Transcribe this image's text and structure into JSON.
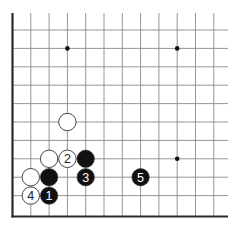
{
  "diagram": {
    "type": "go-board-fragment",
    "corner": "lower-left",
    "colors": {
      "background": "#ffffff",
      "grid": "#8a8a8a",
      "edge": "#2a2a2a",
      "black_stone": "#111111",
      "white_stone": "#ffffff",
      "stone_outline": "#333333",
      "black_label": "#ffffff",
      "white_label": "#222222"
    },
    "grid": {
      "x_lines": [
        12.5,
        30.8,
        49.1,
        67.4,
        85.7,
        104.0,
        122.3,
        140.6,
        158.9,
        177.2,
        195.5,
        213.8
      ],
      "y_lines": [
        30,
        48.4,
        66.8,
        85.2,
        103.6,
        122,
        140.4,
        158.8,
        177.2,
        195.6
      ],
      "bottom_edge_y": 216.5,
      "left_edge_x": 12.5,
      "top_y": 13,
      "right_x": 228
    },
    "hoshi": [
      {
        "col": 3,
        "row": 1
      },
      {
        "col": 9,
        "row": 1
      },
      {
        "col": 9,
        "row": 7
      }
    ],
    "stones": [
      {
        "color": "white",
        "col": 3,
        "row": 5,
        "label": ""
      },
      {
        "color": "white",
        "col": 2,
        "row": 7,
        "label": ""
      },
      {
        "color": "white",
        "col": 3,
        "row": 7,
        "label": "2"
      },
      {
        "color": "black",
        "col": 4,
        "row": 7,
        "label": ""
      },
      {
        "color": "white",
        "col": 1,
        "row": 8,
        "label": ""
      },
      {
        "color": "black",
        "col": 2,
        "row": 8,
        "label": ""
      },
      {
        "color": "black",
        "col": 4,
        "row": 8,
        "label": "3"
      },
      {
        "color": "black",
        "col": 7,
        "row": 8,
        "label": "5"
      },
      {
        "color": "white",
        "col": 1,
        "row": 9,
        "label": "4"
      },
      {
        "color": "black",
        "col": 2,
        "row": 9,
        "label": "1"
      }
    ]
  }
}
